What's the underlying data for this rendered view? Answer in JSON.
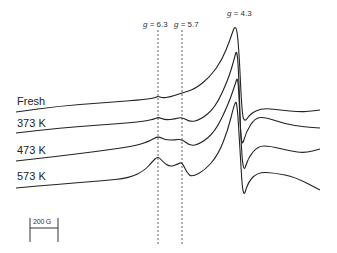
{
  "chart_data": {
    "type": "line",
    "title": "",
    "xlabel": "Magnetic field (scale bar: 200 G)",
    "ylabel": "",
    "grid": false,
    "legend_position": "left, inline trace labels",
    "annotations": [
      {
        "text": "g = 6.3",
        "x_px": 158,
        "style": "dashed vertical line"
      },
      {
        "text": "g = 5.7",
        "x_px": 182,
        "style": "dashed vertical line"
      },
      {
        "text": "g = 4.3",
        "x_px": 236,
        "style": "label at main peak"
      }
    ],
    "scale_bar": {
      "label": "200 G",
      "x_start_px": 30,
      "x_end_px": 58
    },
    "series": [
      {
        "name": "Fresh",
        "points": [
          [
            16,
            112
          ],
          [
            60,
            106
          ],
          [
            100,
            103
          ],
          [
            140,
            100
          ],
          [
            155,
            98
          ],
          [
            158,
            96
          ],
          [
            162,
            98
          ],
          [
            170,
            97
          ],
          [
            182,
            93
          ],
          [
            195,
            89
          ],
          [
            210,
            77
          ],
          [
            222,
            60
          ],
          [
            230,
            40
          ],
          [
            236,
            22
          ],
          [
            239,
            50
          ],
          [
            242,
            115
          ],
          [
            245,
            122
          ],
          [
            250,
            114
          ],
          [
            262,
            108
          ],
          [
            280,
            110
          ],
          [
            300,
            112
          ],
          [
            312,
            111
          ],
          [
            320,
            110
          ]
        ]
      },
      {
        "name": "373 K",
        "points": [
          [
            16,
            133
          ],
          [
            60,
            128
          ],
          [
            100,
            125
          ],
          [
            140,
            122
          ],
          [
            155,
            119
          ],
          [
            158,
            117
          ],
          [
            165,
            120
          ],
          [
            175,
            119
          ],
          [
            182,
            117
          ],
          [
            190,
            122
          ],
          [
            200,
            120
          ],
          [
            215,
            108
          ],
          [
            228,
            80
          ],
          [
            234,
            60
          ],
          [
            237,
            48
          ],
          [
            239,
            80
          ],
          [
            241,
            150
          ],
          [
            246,
            132
          ],
          [
            255,
            118
          ],
          [
            265,
            117
          ],
          [
            285,
            124
          ],
          [
            305,
            127
          ],
          [
            320,
            128
          ]
        ]
      },
      {
        "name": "473 K",
        "points": [
          [
            16,
            161
          ],
          [
            60,
            156
          ],
          [
            100,
            151
          ],
          [
            135,
            146
          ],
          [
            150,
            141
          ],
          [
            158,
            136
          ],
          [
            165,
            140
          ],
          [
            175,
            140
          ],
          [
            182,
            139
          ],
          [
            190,
            146
          ],
          [
            200,
            144
          ],
          [
            215,
            132
          ],
          [
            228,
            105
          ],
          [
            235,
            85
          ],
          [
            238,
            75
          ],
          [
            240,
            120
          ],
          [
            243,
            175
          ],
          [
            248,
            158
          ],
          [
            258,
            146
          ],
          [
            270,
            146
          ],
          [
            290,
            151
          ],
          [
            305,
            153
          ],
          [
            320,
            149
          ]
        ]
      },
      {
        "name": "573 K",
        "points": [
          [
            16,
            188
          ],
          [
            60,
            184
          ],
          [
            100,
            181
          ],
          [
            130,
            178
          ],
          [
            145,
            170
          ],
          [
            152,
            162
          ],
          [
            158,
            156
          ],
          [
            163,
            162
          ],
          [
            170,
            167
          ],
          [
            178,
            164
          ],
          [
            182,
            162
          ],
          [
            187,
            173
          ],
          [
            192,
            177
          ],
          [
            205,
            170
          ],
          [
            218,
            155
          ],
          [
            228,
            130
          ],
          [
            234,
            105
          ],
          [
            237,
            100
          ],
          [
            240,
            150
          ],
          [
            243,
            200
          ],
          [
            248,
            182
          ],
          [
            258,
            172
          ],
          [
            275,
            173
          ],
          [
            295,
            177
          ],
          [
            320,
            190
          ]
        ]
      }
    ]
  },
  "labels": {
    "fresh": "Fresh",
    "k373": "373 K",
    "k473": "473 K",
    "k573": "573 K",
    "g63_sym": "g",
    "g63_val": " = 6.3",
    "g57_sym": "g",
    "g57_val": " = 5.7",
    "g43_sym": "g",
    "g43_val": " = 4.3",
    "scale": "200 G"
  }
}
